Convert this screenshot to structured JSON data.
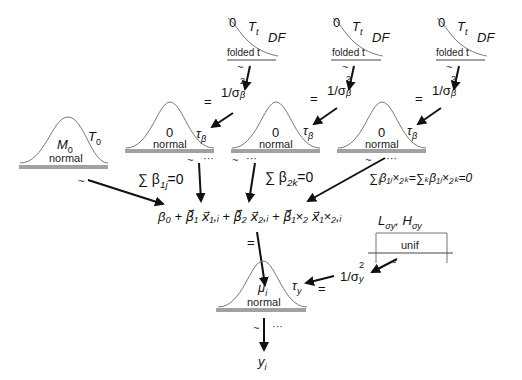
{
  "diagram": {
    "type": "hierarchical-bayesian-model",
    "colors": {
      "lines": "#111111",
      "curves": "#777777"
    },
    "folded_t_priors": [
      {
        "id": "ft1",
        "left": "0",
        "scale": "T",
        "scale_sub": "t",
        "df": "DF",
        "name": "folded t",
        "relation": "~"
      },
      {
        "id": "ft2",
        "left": "0",
        "scale": "T",
        "scale_sub": "t",
        "df": "DF",
        "name": "folded t",
        "relation": "~"
      },
      {
        "id": "ft3",
        "left": "0",
        "scale": "T",
        "scale_sub": "t",
        "df": "DF",
        "name": "folded t",
        "relation": "~"
      }
    ],
    "precision_transforms": [
      {
        "eq": "=",
        "expr": "1/σ",
        "sup": "2",
        "sub": "β",
        "target": "τ",
        "target_sub": "β"
      },
      {
        "eq": "=",
        "expr": "1/σ",
        "sup": "2",
        "sub": "β",
        "target": "τ",
        "target_sub": "β"
      },
      {
        "eq": "=",
        "expr": "1/σ",
        "sup": "2",
        "sub": "β",
        "target": "τ",
        "target_sub": "β"
      }
    ],
    "normal_priors": [
      {
        "id": "n0",
        "mean": "M",
        "mean_sub": "0",
        "precision": "T",
        "precision_sub": "0",
        "name": "normal",
        "relation": "~"
      },
      {
        "id": "n1",
        "mean": "0",
        "name": "normal",
        "relation": "~",
        "dots": "···",
        "constraint": "∑ β",
        "constraint_sub": "1j",
        "constraint_rhs": "=0"
      },
      {
        "id": "n2",
        "mean": "0",
        "name": "normal",
        "relation": "~",
        "dots": "···",
        "constraint": "∑ β",
        "constraint_sub": "2k",
        "constraint_rhs": "=0"
      },
      {
        "id": "n3",
        "mean": "0",
        "name": "normal",
        "relation": "~",
        "dots": "···",
        "constraint": "∑",
        "constraint_full": "∑ⱼβ₁ⱼ×₂ₖ=∑ₖβ₁ⱼ×₂ₖ=0"
      }
    ],
    "linear_predictor": "β₀ + β⃗₁ x⃗₁,ᵢ + β⃗₂ x⃗₂,ᵢ + β⃗₁×₂ x⃗₁×₂,ᵢ",
    "linear_predictor_eq": "=",
    "uniform_prior": {
      "params": "L",
      "params_sub": "σy",
      "params2": "H",
      "params2_sub": "σy",
      "name": "unif",
      "relation": "~"
    },
    "noise_precision": {
      "expr": "1/σ",
      "sup": "2",
      "sub": "y",
      "eq": "=",
      "target": "τ",
      "target_sub": "y"
    },
    "likelihood": {
      "mean": "μ",
      "mean_sub": "i",
      "name": "normal",
      "relation": "~",
      "dots": "···",
      "data": "y",
      "data_sub": "i"
    }
  }
}
